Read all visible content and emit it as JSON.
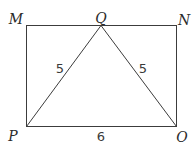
{
  "diagram": {
    "type": "geometry",
    "shapes": {
      "rectangle": {
        "name": "MNOP",
        "vertices": [
          "M",
          "N",
          "O",
          "P"
        ]
      },
      "triangle": {
        "name": "PQO",
        "vertices": [
          "P",
          "Q",
          "O"
        ]
      }
    },
    "points": {
      "M": {
        "label": "M"
      },
      "Q": {
        "label": "Q"
      },
      "N": {
        "label": "N"
      },
      "P": {
        "label": "P"
      },
      "O": {
        "label": "O"
      }
    },
    "measurements": {
      "PQ": "5",
      "QO": "5",
      "PO": "6"
    },
    "colors": {
      "stroke": "#3c3c3c",
      "background": "#ffffff"
    }
  }
}
